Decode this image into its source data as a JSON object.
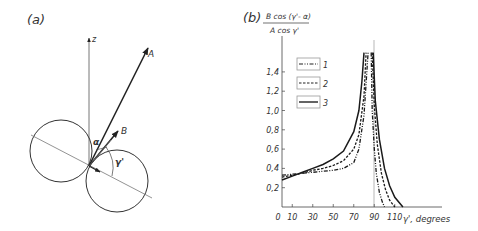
{
  "panel_a": {
    "label": "(a)",
    "axis_label_z": "z",
    "vector_A": "A",
    "vector_B": "B",
    "angle_alpha": "α",
    "angle_gamma": "γ'"
  },
  "panel_b": {
    "label": "(b)",
    "ylabel_numerator": "B cos (γ'- α)",
    "ylabel_denominator": "A cos γ'",
    "xlabel": "γ', degrees",
    "legend": [
      {
        "label": "1",
        "style": "dash-dot-dot"
      },
      {
        "label": "2",
        "style": "dashed"
      },
      {
        "label": "3",
        "style": "solid"
      }
    ]
  },
  "chart_data": {
    "type": "line",
    "title": "",
    "xlabel": "γ', degrees",
    "ylabel": "B cos(γ' - α) / A cos γ'",
    "x_ticks": [
      "0",
      "10",
      "30",
      "50",
      "70",
      "90",
      "110"
    ],
    "y_ticks": [
      "0,2",
      "0,4",
      "0,6",
      "0,8",
      "1,0",
      "1,2",
      "1,4"
    ],
    "xlim": [
      0,
      125
    ],
    "ylim": [
      0,
      1.6
    ],
    "vertical_reference_line": 90,
    "series": [
      {
        "name": "1",
        "style": "dash-dot-dot",
        "left_branch": {
          "x": [
            0,
            10,
            20,
            30,
            40,
            50,
            60,
            70,
            75,
            80,
            84
          ],
          "y": [
            0.33,
            0.34,
            0.35,
            0.36,
            0.37,
            0.38,
            0.4,
            0.46,
            0.6,
            0.95,
            1.6
          ]
        },
        "right_branch": {
          "x": [
            87,
            88,
            90,
            92,
            95,
            98,
            100
          ],
          "y": [
            1.6,
            1.0,
            0.6,
            0.35,
            0.15,
            0.05,
            0
          ]
        }
      },
      {
        "name": "2",
        "style": "dashed",
        "left_branch": {
          "x": [
            0,
            10,
            20,
            30,
            40,
            50,
            60,
            70,
            75,
            80,
            82
          ],
          "y": [
            0.31,
            0.33,
            0.35,
            0.38,
            0.4,
            0.43,
            0.48,
            0.6,
            0.75,
            1.15,
            1.6
          ]
        },
        "right_branch": {
          "x": [
            88,
            90,
            93,
            97,
            101,
            105,
            110
          ],
          "y": [
            1.6,
            1.05,
            0.65,
            0.35,
            0.18,
            0.07,
            0
          ]
        }
      },
      {
        "name": "3",
        "style": "solid",
        "left_branch": {
          "x": [
            0,
            10,
            20,
            30,
            40,
            50,
            60,
            70,
            75,
            78,
            80
          ],
          "y": [
            0.28,
            0.32,
            0.36,
            0.4,
            0.44,
            0.5,
            0.58,
            0.78,
            1.0,
            1.3,
            1.6
          ]
        },
        "right_branch": {
          "x": [
            89,
            91,
            95,
            100,
            105,
            110,
            118
          ],
          "y": [
            1.6,
            1.1,
            0.7,
            0.4,
            0.22,
            0.1,
            0
          ]
        }
      }
    ],
    "legend_position": "upper-left inside"
  }
}
